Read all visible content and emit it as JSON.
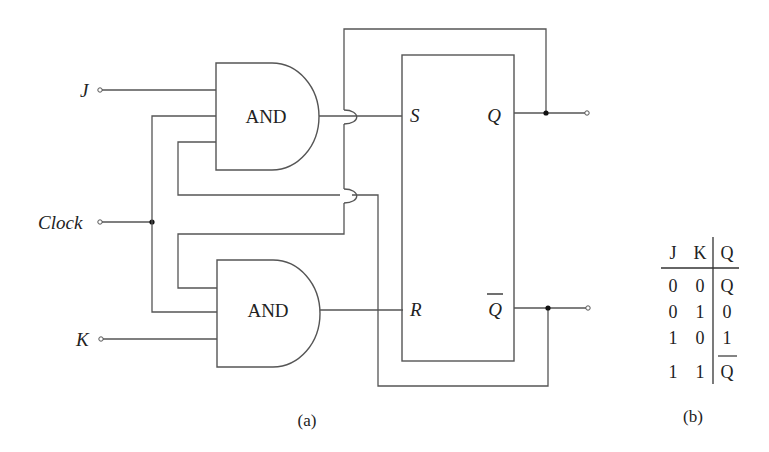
{
  "diagram": {
    "inputs": {
      "j_label": "J",
      "clock_label": "Clock",
      "k_label": "K"
    },
    "gates": {
      "upper_gate_label": "AND",
      "lower_gate_label": "AND"
    },
    "flip_flop": {
      "s_label": "S",
      "r_label": "R",
      "q_label": "Q",
      "qbar_label": "Q"
    },
    "caption_a": "(a)",
    "caption_b": "(b)"
  },
  "truth_table": {
    "headers": [
      "J",
      "K",
      "Q"
    ],
    "rows": [
      {
        "j": "0",
        "k": "0",
        "q": "Q",
        "q_overline": false
      },
      {
        "j": "0",
        "k": "1",
        "q": "0",
        "q_overline": false
      },
      {
        "j": "1",
        "k": "0",
        "q": "1",
        "q_overline": false
      },
      {
        "j": "1",
        "k": "1",
        "q": "Q",
        "q_overline": true
      }
    ]
  }
}
